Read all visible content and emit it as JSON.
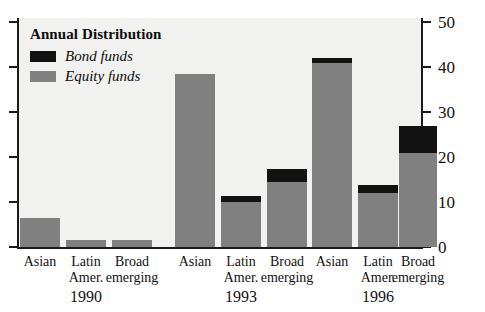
{
  "chart_data": {
    "type": "bar",
    "stacked": true,
    "title": "",
    "legend_title": "Annual Distribution",
    "legend_position": "top-left-inside",
    "xlabel": "",
    "ylabel": "",
    "ylim": [
      0,
      50
    ],
    "yticks": [
      0,
      10,
      20,
      30,
      40,
      50
    ],
    "ytick_labels": [
      "0",
      "10",
      "20",
      "30",
      "40",
      "50"
    ],
    "y_axis_side": "right",
    "grid": false,
    "categories": [
      "Asian",
      "Latin Amer.",
      "Broad emerging",
      "Asian",
      "Latin Amer.",
      "Broad emerging",
      "Asian",
      "Latin Amer.",
      "Broad emerging"
    ],
    "groups": [
      {
        "year": "1990",
        "categories": [
          "Asian",
          "Latin Amer.",
          "Broad emerging"
        ]
      },
      {
        "year": "1993",
        "categories": [
          "Asian",
          "Latin Amer.",
          "Broad emerging"
        ]
      },
      {
        "year": "1996",
        "categories": [
          "Asian",
          "Latin Amer.",
          "Broad emerging"
        ]
      }
    ],
    "series": [
      {
        "name": "Equity funds",
        "color": "#808080",
        "values": [
          6.5,
          1.5,
          1.5,
          38.5,
          10.0,
          14.5,
          41.0,
          12.0,
          21.0
        ]
      },
      {
        "name": "Bond funds",
        "color": "#121212",
        "values": [
          0.0,
          0.0,
          0.0,
          0.0,
          1.3,
          2.8,
          1.0,
          1.8,
          6.0
        ]
      }
    ],
    "totals": [
      6.5,
      1.5,
      1.5,
      38.5,
      11.3,
      17.3,
      42.0,
      13.8,
      27.0
    ]
  },
  "legend": {
    "title": "Annual Distribution",
    "items": [
      {
        "label": "Bond funds",
        "color": "#121212"
      },
      {
        "label": "Equity funds",
        "color": "#808080"
      }
    ]
  },
  "axis": {
    "right_labels": [
      "50",
      "40",
      "30",
      "20",
      "10",
      "0"
    ]
  },
  "bars": [
    {
      "name": "asian-1990",
      "line1": "Asian",
      "line2": "",
      "x": 20,
      "w": 40,
      "equity": 6.5,
      "bond": 0.0
    },
    {
      "name": "latin-amer-1990",
      "line1": "Latin",
      "line2": "Amer.",
      "x": 66,
      "w": 40,
      "equity": 1.5,
      "bond": 0.0
    },
    {
      "name": "broad-emerging-1990",
      "line1": "Broad",
      "line2": "emerging",
      "x": 112,
      "w": 40,
      "equity": 1.5,
      "bond": 0.0
    },
    {
      "name": "asian-1993",
      "line1": "Asian",
      "line2": "",
      "x": 175,
      "w": 40,
      "equity": 38.5,
      "bond": 0.0
    },
    {
      "name": "latin-amer-1993",
      "line1": "Latin",
      "line2": "Amer.",
      "x": 221,
      "w": 40,
      "equity": 10.0,
      "bond": 1.3
    },
    {
      "name": "broad-emerging-1993",
      "line1": "Broad",
      "line2": "emerging",
      "x": 267,
      "w": 40,
      "equity": 14.5,
      "bond": 2.8
    },
    {
      "name": "asian-1996",
      "line1": "Asian",
      "line2": "",
      "x": 312,
      "w": 40,
      "equity": 41.0,
      "bond": 1.0
    },
    {
      "name": "latin-amer-1996",
      "line1": "Latin",
      "line2": "Amer.",
      "x": 358,
      "w": 40,
      "equity": 12.0,
      "bond": 1.8
    },
    {
      "name": "broad-emerging-1996",
      "line1": "Broad",
      "line2": "emerging",
      "x": 399,
      "w": 38,
      "equity": 21.0,
      "bond": 6.0
    }
  ],
  "years": [
    {
      "label": "1990",
      "center": 86
    },
    {
      "label": "1993",
      "center": 241
    },
    {
      "label": "1996",
      "center": 378
    }
  ]
}
